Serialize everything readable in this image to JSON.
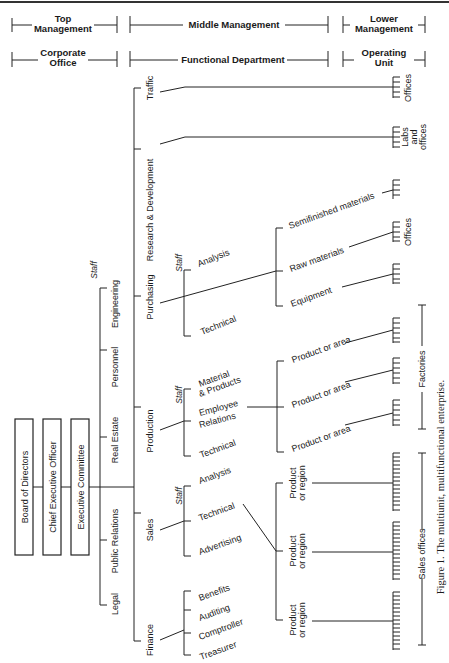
{
  "headers": {
    "row1": {
      "top": {
        "line1": "Top",
        "line2": "Management"
      },
      "middle": "Middle Management",
      "lower": {
        "line1": "Lower",
        "line2": "Management"
      }
    },
    "row2": {
      "corporate": {
        "line1": "Corporate",
        "line2": "Office"
      },
      "functional": "Functional Department",
      "operating": {
        "line1": "Operating",
        "line2": "Unit"
      }
    }
  },
  "top_boxes": [
    "Board of Directors",
    "Chief Executive Officer",
    "Executive Committee"
  ],
  "corporate_staff": {
    "label": "Staff",
    "items": [
      "Engineering",
      "Personnel",
      "Real Estate",
      "Public Relations",
      "Legal"
    ]
  },
  "departments": {
    "traffic": {
      "label": "Traffic",
      "unit": "Offices"
    },
    "rnd": {
      "label": "Research & Development",
      "unit": {
        "line1": "Labs",
        "line2": "and",
        "line3": "offices"
      }
    },
    "purchasing": {
      "label": "Purchasing",
      "staff_label": "Staff",
      "staff": [
        "Analysis",
        "Technical"
      ],
      "subunits": [
        "Semifinished materials",
        "Raw materials",
        "Equipment"
      ],
      "unit": "Offices"
    },
    "production": {
      "label": "Production",
      "staff_label": "Staff",
      "staff": [
        {
          "line1": "Material",
          "line2": "& Products"
        },
        {
          "line1": "Employee",
          "line2": "Relations"
        },
        "Technical"
      ],
      "subunits": [
        "Product or area",
        "Product or area",
        "Product or area"
      ],
      "unit": "Factories"
    },
    "sales": {
      "label": "Sales",
      "staff_label": "Staff",
      "staff": [
        "Analysis",
        "Technical",
        "Advertising"
      ],
      "subunits": [
        {
          "line1": "Product",
          "line2": "or region"
        },
        {
          "line1": "Product",
          "line2": "or region"
        },
        {
          "line1": "Product",
          "line2": "or region"
        }
      ],
      "unit": "Sales offices"
    },
    "finance": {
      "label": "Finance",
      "staff": [
        "Benefits",
        "Auditing",
        "Comptroller",
        "Treasurer"
      ]
    }
  },
  "caption": "Figure 1.  The multiunit, multifunctional enterprise."
}
